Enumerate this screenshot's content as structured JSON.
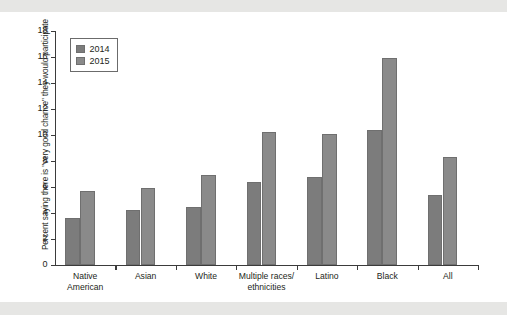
{
  "chart_data": {
    "type": "bar",
    "title": "",
    "xlabel": "",
    "ylabel": "Percent saying there is \"very good chance\" they would participate",
    "ylim": [
      0,
      18
    ],
    "yticks": [
      0,
      2,
      4,
      6,
      8,
      10,
      12,
      14,
      16,
      18
    ],
    "ytick_labels": [
      "0",
      "2",
      "4",
      "6",
      "8",
      "10",
      "12",
      "14",
      "16",
      "18"
    ],
    "grid": false,
    "legend_position": "top-left",
    "categories": [
      "Native\nAmerican",
      "Asian",
      "White",
      "Multiple races/\nethnicities",
      "Latino",
      "Black",
      "All"
    ],
    "series": [
      {
        "name": "2014",
        "color": "#7c7c7c",
        "values": [
          3.6,
          4.2,
          4.5,
          6.4,
          6.8,
          10.4,
          5.4
        ]
      },
      {
        "name": "2015",
        "color": "#8a8a8a",
        "values": [
          5.7,
          5.9,
          6.9,
          10.2,
          10.1,
          15.9,
          8.3
        ]
      }
    ]
  }
}
